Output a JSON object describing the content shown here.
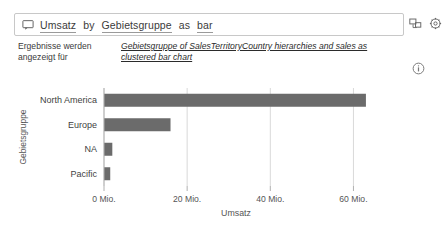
{
  "qna": {
    "icon": "qna-speech-bubble-icon",
    "query_value": "Umsatz by Gebietsgruppe as bar",
    "query_placeholder": "Stellen Sie eine Frage zu Ihren Daten",
    "tokens": [
      {
        "text": "Umsatz",
        "underlined": true
      },
      {
        "text": "by",
        "underlined": false
      },
      {
        "text": "Gebietsgruppe",
        "underlined": true
      },
      {
        "text": "as",
        "underlined": false
      },
      {
        "text": "bar",
        "underlined": true
      }
    ],
    "actions": [
      {
        "name": "pin-visual-icon",
        "label": "Visual anheften"
      },
      {
        "name": "settings-gear-icon",
        "label": "Einstellungen"
      }
    ]
  },
  "description": {
    "label": "Ergebnisse werden angezeigt für",
    "link": "Gebietsgruppe of SalesTerritoryCountry hierarchies and sales as clustered bar chart",
    "info_icon": "info-circle-icon"
  },
  "chart_data": {
    "type": "bar",
    "orientation": "horizontal",
    "title": "",
    "categories": [
      "North America",
      "Europe",
      "NA",
      "Pacific"
    ],
    "values": [
      63,
      16,
      2,
      1.5
    ],
    "series": [
      {
        "name": "Umsatz",
        "values": [
          63,
          16,
          2,
          1.5
        ]
      }
    ],
    "xlabel": "Umsatz",
    "ylabel": "Gebietsgruppe",
    "xlim": [
      0,
      63.5
    ],
    "xticks": [
      0,
      20,
      40,
      60
    ],
    "xtick_labels": [
      "0 Mio.",
      "20 Mio.",
      "40 Mio.",
      "60 Mio."
    ],
    "grid": true,
    "legend": false,
    "bar_color": "#6b6b6b",
    "gridline_color": "#d9d9d9"
  },
  "theme": {
    "background": "#ffffff",
    "border": "#c8c8c8",
    "text": "#333333"
  }
}
